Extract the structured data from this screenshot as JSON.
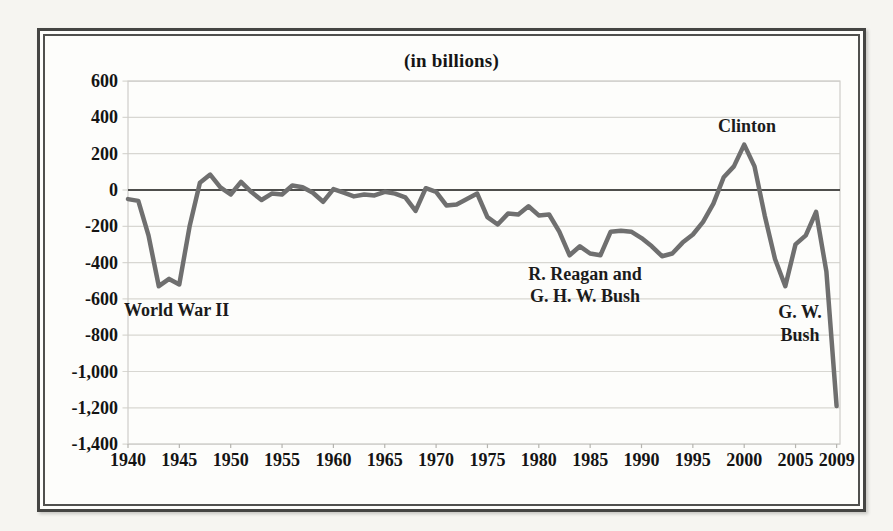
{
  "figure": {
    "title": "(in billions)",
    "annotations": {
      "wwii": {
        "line1": "World War II"
      },
      "reagan_bush": {
        "line1": "R. Reagan and",
        "line2": "G. H. W. Bush"
      },
      "clinton": {
        "line1": "Clinton"
      },
      "gw_bush": {
        "line1": "G. W.",
        "line2": "Bush"
      }
    }
  },
  "chart_data": {
    "type": "line",
    "title": "(in billions)",
    "x": [
      1940,
      1941,
      1942,
      1943,
      1944,
      1945,
      1946,
      1947,
      1948,
      1949,
      1950,
      1951,
      1952,
      1953,
      1954,
      1955,
      1956,
      1957,
      1958,
      1959,
      1960,
      1961,
      1962,
      1963,
      1964,
      1965,
      1966,
      1967,
      1968,
      1969,
      1970,
      1971,
      1972,
      1973,
      1974,
      1975,
      1976,
      1977,
      1978,
      1979,
      1980,
      1981,
      1982,
      1983,
      1984,
      1985,
      1986,
      1987,
      1988,
      1989,
      1990,
      1991,
      1992,
      1993,
      1994,
      1995,
      1996,
      1997,
      1998,
      1999,
      2000,
      2001,
      2002,
      2003,
      2004,
      2005,
      2006,
      2007,
      2008,
      2009
    ],
    "values": [
      -50,
      -60,
      -250,
      -530,
      -490,
      -520,
      -200,
      40,
      85,
      15,
      -25,
      45,
      -10,
      -55,
      -20,
      -25,
      25,
      15,
      -15,
      -65,
      5,
      -15,
      -35,
      -25,
      -30,
      -10,
      -20,
      -40,
      -115,
      10,
      -10,
      -85,
      -80,
      -50,
      -20,
      -150,
      -190,
      -130,
      -135,
      -90,
      -140,
      -135,
      -230,
      -360,
      -310,
      -350,
      -360,
      -230,
      -225,
      -230,
      -265,
      -310,
      -365,
      -350,
      -290,
      -245,
      -175,
      -75,
      70,
      130,
      250,
      130,
      -140,
      -380,
      -530,
      -300,
      -250,
      -120,
      -450,
      -1190
    ],
    "x_tick_labels": [
      "1940",
      "1945",
      "1950",
      "1955",
      "1960",
      "1965",
      "1970",
      "1975",
      "1980",
      "1985",
      "1990",
      "1995",
      "2000",
      "2005",
      "2009"
    ],
    "x_tick_years": [
      1940,
      1945,
      1950,
      1955,
      1960,
      1965,
      1970,
      1975,
      1980,
      1985,
      1990,
      1995,
      2000,
      2005,
      2009
    ],
    "y_tick_labels": [
      "600",
      "400",
      "200",
      "0",
      "-200",
      "-400",
      "-600",
      "-800",
      "-1,000",
      "-1,200",
      "-1,400"
    ],
    "y_tick_values": [
      600,
      400,
      200,
      0,
      -200,
      -400,
      -600,
      -800,
      -1000,
      -1200,
      -1400
    ],
    "xlim": [
      1940,
      2009
    ],
    "ylim": [
      -1400,
      600
    ],
    "grid": "horizontal",
    "legend": "none",
    "line_color": "#6f6f6f",
    "zero_line_color": "#4e4e4c",
    "gridline_color": "#d8d7d2",
    "annotations": [
      {
        "text": "World War II",
        "x": 1941,
        "y": -620
      },
      {
        "text": "R. Reagan and G. H. W. Bush",
        "x": 1984,
        "y": -460
      },
      {
        "text": "Clinton",
        "x": 2000,
        "y": 330
      },
      {
        "text": "G. W. Bush",
        "x": 2005.5,
        "y": -650
      }
    ]
  }
}
